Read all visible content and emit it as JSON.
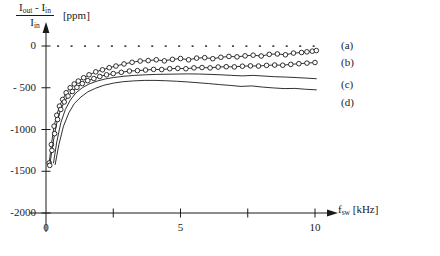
{
  "figure": {
    "background_color": "#ffffff",
    "ink_color": "#1a1a1a"
  },
  "axis": {
    "y_label_numerator_a": "I",
    "y_label_numerator_a_sub": "out",
    "y_label_numerator_minus": " - ",
    "y_label_numerator_b": "I",
    "y_label_numerator_b_sub": "in",
    "y_label_denominator": "I",
    "y_label_denominator_sub": "in",
    "y_label_unit": "[ppm]",
    "x_label_main": "f",
    "x_label_sub": "sw",
    "x_label_unit": "[kHz]"
  },
  "cut_caption": "",
  "chart_data": {
    "type": "line",
    "title": "",
    "xlabel": "f_sw [kHz]",
    "ylabel": "(I_out - I_in) / I_in [ppm]",
    "xlim": [
      0,
      11.6
    ],
    "ylim": [
      -2000,
      180
    ],
    "xticks": [
      0,
      2.5,
      5,
      7.5,
      10
    ],
    "xtick_labels": [
      "0",
      "",
      "5",
      "",
      "10"
    ],
    "yticks": [
      0,
      -500,
      -1000,
      -1500,
      -2000
    ],
    "ytick_labels": [
      "0",
      "- 500",
      "-1000",
      "-1500",
      "-2000"
    ],
    "grid": false,
    "legend_position": "right",
    "zero_line_style": "dotted",
    "series": [
      {
        "name": "(a)",
        "label": "(a)",
        "marker": "circle-open",
        "style": "solid",
        "x": [
          0.12,
          0.2,
          0.3,
          0.4,
          0.5,
          0.62,
          0.75,
          0.9,
          1.05,
          1.2,
          1.4,
          1.6,
          1.85,
          2.1,
          2.35,
          2.6,
          2.9,
          3.2,
          3.5,
          3.8,
          4.1,
          4.4,
          4.7,
          5.0,
          5.3,
          5.6,
          5.9,
          6.2,
          6.5,
          6.8,
          7.1,
          7.4,
          7.7,
          8.0,
          8.3,
          8.6,
          8.9,
          9.2,
          9.5,
          9.7,
          9.9,
          10.05
        ],
        "y": [
          -1400,
          -1180,
          -960,
          -830,
          -720,
          -640,
          -560,
          -500,
          -455,
          -420,
          -380,
          -345,
          -310,
          -285,
          -260,
          -240,
          -215,
          -195,
          -180,
          -175,
          -165,
          -178,
          -160,
          -150,
          -165,
          -145,
          -140,
          -152,
          -135,
          -125,
          -130,
          -118,
          -110,
          -120,
          -100,
          -95,
          -105,
          -85,
          -78,
          -70,
          -62,
          -55
        ]
      },
      {
        "name": "(b)",
        "label": "(b)",
        "marker": "circle-open",
        "style": "solid",
        "x": [
          0.14,
          0.22,
          0.32,
          0.43,
          0.55,
          0.68,
          0.82,
          0.98,
          1.15,
          1.35,
          1.55,
          1.78,
          2.0,
          2.25,
          2.5,
          2.8,
          3.1,
          3.4,
          3.7,
          4.0,
          4.3,
          4.6,
          4.9,
          5.2,
          5.5,
          5.8,
          6.1,
          6.4,
          6.7,
          7.0,
          7.3,
          7.6,
          7.9,
          8.2,
          8.5,
          8.8,
          9.1,
          9.4,
          9.7,
          10.0
        ],
        "y": [
          -1430,
          -1250,
          -1050,
          -880,
          -760,
          -670,
          -600,
          -545,
          -495,
          -450,
          -415,
          -390,
          -365,
          -345,
          -330,
          -315,
          -300,
          -295,
          -288,
          -280,
          -282,
          -272,
          -268,
          -272,
          -262,
          -258,
          -262,
          -252,
          -248,
          -250,
          -242,
          -238,
          -240,
          -232,
          -228,
          -230,
          -220,
          -212,
          -205,
          -198
        ]
      },
      {
        "name": "(c)",
        "label": "(c)",
        "marker": "none",
        "style": "solid",
        "x": [
          0.28,
          0.4,
          0.55,
          0.72,
          0.9,
          1.1,
          1.35,
          1.6,
          1.9,
          2.2,
          2.5,
          2.9,
          3.3,
          3.7,
          4.1,
          4.5,
          4.9,
          5.3,
          5.7,
          6.1,
          6.5,
          6.9,
          7.3,
          7.7,
          8.1,
          8.5,
          8.9,
          9.3,
          9.7,
          10.05
        ],
        "y": [
          -1400,
          -1150,
          -920,
          -760,
          -650,
          -565,
          -500,
          -455,
          -420,
          -395,
          -378,
          -362,
          -352,
          -345,
          -340,
          -338,
          -336,
          -334,
          -336,
          -340,
          -345,
          -352,
          -358,
          -352,
          -360,
          -368,
          -372,
          -378,
          -385,
          -392
        ]
      },
      {
        "name": "(d)",
        "label": "(d)",
        "marker": "none",
        "style": "solid",
        "x": [
          0.34,
          0.48,
          0.65,
          0.85,
          1.05,
          1.3,
          1.55,
          1.85,
          2.15,
          2.5,
          2.85,
          3.25,
          3.65,
          4.05,
          4.45,
          4.85,
          5.25,
          5.65,
          6.05,
          6.45,
          6.85,
          7.25,
          7.65,
          8.05,
          8.45,
          8.85,
          9.25,
          9.65,
          10.05
        ],
        "y": [
          -1420,
          -1180,
          -960,
          -800,
          -690,
          -610,
          -550,
          -505,
          -470,
          -445,
          -428,
          -418,
          -412,
          -412,
          -416,
          -422,
          -430,
          -440,
          -450,
          -462,
          -472,
          -484,
          -478,
          -492,
          -502,
          -510,
          -508,
          -518,
          -525
        ]
      }
    ],
    "zero_dots_x": [
      0.45,
      0.95,
      1.45,
      1.95,
      2.45,
      2.95,
      3.45,
      3.95,
      4.45,
      4.95,
      5.45,
      5.95,
      6.45,
      6.95,
      7.45,
      7.95,
      8.45,
      8.95,
      9.45,
      9.95
    ],
    "zero_dots_y": 0
  },
  "legend": {
    "items": [
      {
        "label": "(a)"
      },
      {
        "label": "(b)"
      },
      {
        "label": "(c)"
      },
      {
        "label": "(d)"
      }
    ]
  }
}
